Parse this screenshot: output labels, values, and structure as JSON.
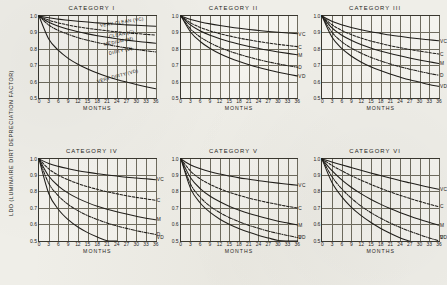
{
  "figure": {
    "ylabel": "LDD (LUMINAIRE DIRT DEPRECIATION FACTOR)",
    "xlabel": "MONTHS",
    "background_color": "#efeee8",
    "line_color": "#1f1d19",
    "grid_color": "#6e6b5e"
  },
  "axes": {
    "y_ticks": [
      "1.0",
      "0.9",
      "0.8",
      "0.7",
      "0.6",
      "0.5"
    ],
    "y_values": [
      1.0,
      0.9,
      0.8,
      0.7,
      0.6,
      0.5
    ],
    "x_ticks": [
      "0",
      "3",
      "6",
      "9",
      "12",
      "15",
      "18",
      "21",
      "24",
      "27",
      "30",
      "33",
      "36"
    ],
    "x_values": [
      0,
      3,
      6,
      9,
      12,
      15,
      18,
      21,
      24,
      27,
      30,
      33,
      36
    ],
    "ylim": [
      0.5,
      1.0
    ],
    "xlim": [
      0,
      36
    ]
  },
  "condition_labels": {
    "vc_long": "VERY CLEAN (VC)",
    "c_long": "CLEAN (C)",
    "m_long": "MEDIUM (M)",
    "d_long": "DIRTY (D)",
    "vd_long": "VERY DIRTY (VD)",
    "vc_short": "VC",
    "c_short": "C",
    "m_short": "M",
    "d_short": "D",
    "vd_short": "VD"
  },
  "chart_data": [
    {
      "type": "line",
      "title": "CATEGORY I",
      "xlabel": "MONTHS",
      "ylabel": "LDD (LUMINAIRE DIRT DEPRECIATION FACTOR)",
      "xlim": [
        0,
        36
      ],
      "ylim": [
        0.5,
        1.0
      ],
      "grid": true,
      "legend": "inline-curve-labels",
      "x": [
        0,
        3,
        6,
        9,
        12,
        15,
        18,
        21,
        24,
        27,
        30,
        33,
        36
      ],
      "series": [
        {
          "name": "VERY CLEAN (VC)",
          "code": "VC",
          "dash": "solid",
          "values": [
            1.0,
            0.989,
            0.981,
            0.974,
            0.968,
            0.963,
            0.958,
            0.954,
            0.95,
            0.946,
            0.943,
            0.94,
            0.937
          ]
        },
        {
          "name": "CLEAN (C)",
          "code": "C",
          "dash": "dashed",
          "values": [
            1.0,
            0.975,
            0.958,
            0.945,
            0.934,
            0.925,
            0.917,
            0.91,
            0.904,
            0.898,
            0.893,
            0.888,
            0.884
          ]
        },
        {
          "name": "MEDIUM (M)",
          "code": "M",
          "dash": "solid",
          "values": [
            1.0,
            0.962,
            0.938,
            0.919,
            0.904,
            0.891,
            0.88,
            0.87,
            0.861,
            0.853,
            0.846,
            0.84,
            0.834
          ]
        },
        {
          "name": "DIRTY (D)",
          "code": "D",
          "dash": "dashdot",
          "values": [
            1.0,
            0.945,
            0.912,
            0.888,
            0.868,
            0.852,
            0.838,
            0.826,
            0.815,
            0.805,
            0.796,
            0.788,
            0.781
          ]
        },
        {
          "name": "VERY DIRTY (VD)",
          "code": "VD",
          "dash": "solid",
          "values": [
            1.0,
            0.86,
            0.79,
            0.742,
            0.706,
            0.677,
            0.652,
            0.631,
            0.613,
            0.597,
            0.582,
            0.569,
            0.557
          ]
        }
      ]
    },
    {
      "type": "line",
      "title": "CATEGORY II",
      "xlabel": "MONTHS",
      "ylabel": "",
      "xlim": [
        0,
        36
      ],
      "ylim": [
        0.5,
        1.0
      ],
      "grid": true,
      "legend": "right-edge-codes",
      "x": [
        0,
        3,
        6,
        9,
        12,
        15,
        18,
        21,
        24,
        27,
        30,
        33,
        36
      ],
      "series": [
        {
          "name": "VERY CLEAN",
          "code": "VC",
          "dash": "solid",
          "values": [
            1.0,
            0.979,
            0.964,
            0.952,
            0.942,
            0.933,
            0.925,
            0.918,
            0.912,
            0.906,
            0.901,
            0.896,
            0.892
          ]
        },
        {
          "name": "CLEAN",
          "code": "C",
          "dash": "dashed",
          "values": [
            1.0,
            0.958,
            0.93,
            0.909,
            0.892,
            0.878,
            0.865,
            0.854,
            0.844,
            0.835,
            0.827,
            0.82,
            0.813
          ]
        },
        {
          "name": "MEDIUM",
          "code": "M",
          "dash": "solid",
          "values": [
            1.0,
            0.944,
            0.908,
            0.882,
            0.861,
            0.843,
            0.828,
            0.814,
            0.802,
            0.791,
            0.781,
            0.772,
            0.764
          ]
        },
        {
          "name": "DIRTY",
          "code": "D",
          "dash": "dashdot",
          "values": [
            1.0,
            0.92,
            0.871,
            0.836,
            0.808,
            0.785,
            0.766,
            0.749,
            0.734,
            0.72,
            0.708,
            0.697,
            0.687
          ]
        },
        {
          "name": "VERY DIRTY",
          "code": "VD",
          "dash": "solid",
          "values": [
            1.0,
            0.901,
            0.843,
            0.802,
            0.77,
            0.744,
            0.722,
            0.703,
            0.686,
            0.671,
            0.657,
            0.645,
            0.634
          ]
        }
      ]
    },
    {
      "type": "line",
      "title": "CATEGORY III",
      "xlabel": "MONTHS",
      "ylabel": "",
      "xlim": [
        0,
        36
      ],
      "ylim": [
        0.5,
        1.0
      ],
      "grid": true,
      "legend": "right-edge-codes",
      "x": [
        0,
        3,
        6,
        9,
        12,
        15,
        18,
        21,
        24,
        27,
        30,
        33,
        36
      ],
      "series": [
        {
          "name": "VERY CLEAN",
          "code": "VC",
          "dash": "solid",
          "values": [
            1.0,
            0.968,
            0.947,
            0.93,
            0.916,
            0.904,
            0.894,
            0.884,
            0.876,
            0.868,
            0.861,
            0.855,
            0.849
          ]
        },
        {
          "name": "CLEAN",
          "code": "C",
          "dash": "dashed",
          "values": [
            1.0,
            0.948,
            0.913,
            0.887,
            0.866,
            0.848,
            0.833,
            0.819,
            0.807,
            0.796,
            0.786,
            0.777,
            0.768
          ]
        },
        {
          "name": "MEDIUM",
          "code": "M",
          "dash": "solid",
          "values": [
            1.0,
            0.929,
            0.884,
            0.852,
            0.826,
            0.805,
            0.787,
            0.771,
            0.757,
            0.744,
            0.732,
            0.721,
            0.711
          ]
        },
        {
          "name": "DIRTY",
          "code": "D",
          "dash": "dashdot",
          "values": [
            1.0,
            0.903,
            0.845,
            0.805,
            0.774,
            0.748,
            0.727,
            0.708,
            0.691,
            0.676,
            0.663,
            0.65,
            0.639
          ]
        },
        {
          "name": "VERY DIRTY",
          "code": "VD",
          "dash": "solid",
          "values": [
            1.0,
            0.874,
            0.804,
            0.756,
            0.72,
            0.691,
            0.667,
            0.646,
            0.628,
            0.611,
            0.597,
            0.583,
            0.571
          ]
        }
      ]
    },
    {
      "type": "line",
      "title": "CATEGORY IV",
      "xlabel": "MONTHS",
      "ylabel": "",
      "xlim": [
        0,
        36
      ],
      "ylim": [
        0.5,
        1.0
      ],
      "grid": true,
      "legend": "right-edge-codes",
      "x": [
        0,
        3,
        6,
        9,
        12,
        15,
        18,
        21,
        24,
        27,
        30,
        33,
        36
      ],
      "series": [
        {
          "name": "VERY CLEAN",
          "code": "VC",
          "dash": "solid",
          "values": [
            1.0,
            0.973,
            0.955,
            0.941,
            0.929,
            0.919,
            0.91,
            0.903,
            0.896,
            0.889,
            0.884,
            0.879,
            0.874
          ]
        },
        {
          "name": "CLEAN",
          "code": "C",
          "dash": "dashed",
          "values": [
            1.0,
            0.94,
            0.901,
            0.873,
            0.85,
            0.831,
            0.815,
            0.8,
            0.788,
            0.776,
            0.766,
            0.757,
            0.748
          ]
        },
        {
          "name": "MEDIUM",
          "code": "M",
          "dash": "solid",
          "values": [
            1.0,
            0.896,
            0.835,
            0.792,
            0.76,
            0.734,
            0.712,
            0.694,
            0.678,
            0.664,
            0.651,
            0.639,
            0.629
          ]
        },
        {
          "name": "DIRTY",
          "code": "D",
          "dash": "dashdot",
          "values": [
            1.0,
            0.852,
            0.775,
            0.723,
            0.685,
            0.655,
            0.631,
            0.61,
            0.592,
            0.577,
            0.563,
            0.551,
            0.54
          ]
        },
        {
          "name": "VERY DIRTY",
          "code": "VD",
          "dash": "solid",
          "values": [
            1.0,
            0.79,
            0.692,
            0.63,
            0.585,
            0.551,
            0.524,
            0.502,
            0.5,
            null,
            null,
            null,
            null
          ]
        }
      ]
    },
    {
      "type": "line",
      "title": "CATEGORY V",
      "xlabel": "MONTHS",
      "ylabel": "",
      "xlim": [
        0,
        36
      ],
      "ylim": [
        0.5,
        1.0
      ],
      "grid": true,
      "legend": "right-edge-codes",
      "x": [
        0,
        3,
        6,
        9,
        12,
        15,
        18,
        21,
        24,
        27,
        30,
        33,
        36
      ],
      "series": [
        {
          "name": "VERY CLEAN",
          "code": "VC",
          "dash": "solid",
          "values": [
            1.0,
            0.963,
            0.94,
            0.922,
            0.908,
            0.896,
            0.885,
            0.876,
            0.867,
            0.86,
            0.853,
            0.846,
            0.84
          ]
        },
        {
          "name": "CLEAN",
          "code": "C",
          "dash": "dashed",
          "values": [
            1.0,
            0.925,
            0.878,
            0.845,
            0.818,
            0.796,
            0.778,
            0.761,
            0.747,
            0.734,
            0.722,
            0.711,
            0.701
          ]
        },
        {
          "name": "MEDIUM",
          "code": "M",
          "dash": "solid",
          "values": [
            1.0,
            0.884,
            0.818,
            0.773,
            0.739,
            0.711,
            0.688,
            0.668,
            0.651,
            0.635,
            0.621,
            0.609,
            0.597
          ]
        },
        {
          "name": "DIRTY",
          "code": "D",
          "dash": "dashdot",
          "values": [
            1.0,
            0.845,
            0.765,
            0.712,
            0.673,
            0.642,
            0.617,
            0.595,
            0.577,
            0.56,
            0.546,
            0.533,
            0.521
          ]
        },
        {
          "name": "VERY DIRTY",
          "code": "VD",
          "dash": "solid",
          "values": [
            1.0,
            0.818,
            0.73,
            0.674,
            0.633,
            0.601,
            0.575,
            0.553,
            0.534,
            0.518,
            0.503,
            0.5,
            0.5
          ]
        }
      ]
    },
    {
      "type": "line",
      "title": "CATEGORY VI",
      "xlabel": "MONTHS",
      "ylabel": "",
      "xlim": [
        0,
        36
      ],
      "ylim": [
        0.5,
        1.0
      ],
      "grid": true,
      "legend": "right-edge-codes",
      "x": [
        0,
        3,
        6,
        9,
        12,
        15,
        18,
        21,
        24,
        27,
        30,
        33,
        36
      ],
      "series": [
        {
          "name": "VERY CLEAN",
          "code": "VC",
          "dash": "solid",
          "values": [
            1.0,
            0.982,
            0.965,
            0.948,
            0.931,
            0.915,
            0.899,
            0.884,
            0.869,
            0.855,
            0.841,
            0.828,
            0.815
          ]
        },
        {
          "name": "CLEAN",
          "code": "C",
          "dash": "dashed",
          "values": [
            1.0,
            0.962,
            0.929,
            0.899,
            0.871,
            0.846,
            0.822,
            0.8,
            0.779,
            0.76,
            0.742,
            0.725,
            0.709
          ]
        },
        {
          "name": "MEDIUM",
          "code": "M",
          "dash": "solid",
          "values": [
            1.0,
            0.93,
            0.874,
            0.828,
            0.789,
            0.755,
            0.725,
            0.698,
            0.674,
            0.652,
            0.632,
            0.614,
            0.597
          ]
        },
        {
          "name": "DIRTY",
          "code": "D",
          "dash": "dashdot",
          "values": [
            1.0,
            0.895,
            0.82,
            0.762,
            0.714,
            0.674,
            0.64,
            0.61,
            0.584,
            0.56,
            0.539,
            0.519,
            0.502
          ]
        },
        {
          "name": "VERY DIRTY",
          "code": "VD",
          "dash": "solid",
          "values": [
            1.0,
            0.86,
            0.772,
            0.707,
            0.656,
            0.614,
            0.578,
            0.547,
            0.52,
            0.5,
            null,
            null,
            null
          ]
        }
      ]
    }
  ],
  "inline_label_positions": [
    {
      "text": "VERY CLEAN (VC)",
      "x_pct": 52,
      "y_pct": 9,
      "rot": -9
    },
    {
      "text": "CLEAN (C)",
      "x_pct": 60,
      "y_pct": 22,
      "rot": -11
    },
    {
      "text": "MEDIUM (M)",
      "x_pct": 56,
      "y_pct": 32,
      "rot": -12
    },
    {
      "text": "DIRTY (D)",
      "x_pct": 60,
      "y_pct": 43,
      "rot": -13
    },
    {
      "text": "VERY DIRTY (VD)",
      "x_pct": 50,
      "y_pct": 77,
      "rot": -15
    }
  ]
}
